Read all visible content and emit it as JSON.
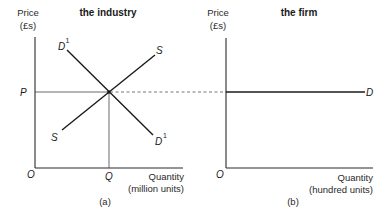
{
  "diagram": {
    "panels": [
      {
        "id": "a",
        "title": "the industry",
        "caption": "(a)",
        "y_axis": {
          "label_line1": "Price",
          "label_line2": "(£s)"
        },
        "x_axis": {
          "label_line1": "Quantity",
          "label_line2": "(million units)"
        },
        "origin_label": "O",
        "price_label": "P",
        "quantity_label": "Q",
        "curves": [
          {
            "name": "demand",
            "label": "D",
            "superscript": "1",
            "slope": "downward"
          },
          {
            "name": "supply",
            "label": "S",
            "superscript": "",
            "slope": "upward"
          }
        ],
        "equilibrium": {
          "price": "P",
          "quantity": "Q"
        }
      },
      {
        "id": "b",
        "title": "the firm",
        "caption": "(b)",
        "y_axis": {
          "label_line1": "Price",
          "label_line2": "(£s)"
        },
        "x_axis": {
          "label_line1": "Quantity",
          "label_line2": "(hundred units)"
        },
        "origin_label": "O",
        "curves": [
          {
            "name": "demand",
            "label": "D",
            "superscript": "",
            "slope": "horizontal at P"
          }
        ]
      }
    ],
    "connector": {
      "style": "dashed",
      "meaning": "market price P carried from industry to firm"
    }
  }
}
